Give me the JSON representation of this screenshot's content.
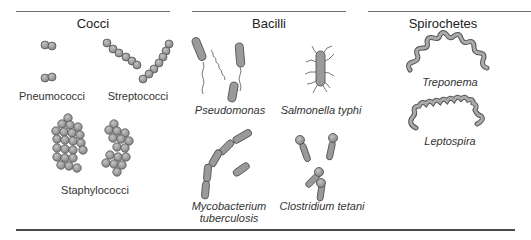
{
  "figure": {
    "groups": [
      {
        "title": "Cocci",
        "organisms": [
          {
            "name": "Pneumococci",
            "italic": false,
            "shape": "diplococci"
          },
          {
            "name": "Streptococci",
            "italic": false,
            "shape": "chains"
          },
          {
            "name": "Staphylococci",
            "italic": false,
            "shape": "clusters"
          }
        ]
      },
      {
        "title": "Bacilli",
        "organisms": [
          {
            "name": "Pseudomonas",
            "italic": true,
            "shape": "rod with polar flagellum"
          },
          {
            "name": "Salmonella typhi",
            "italic": true,
            "shape": "rod with peritrichous flagella"
          },
          {
            "name_line1": "Mycobacterium",
            "name_line2": "tuberculosis",
            "italic": true,
            "shape": "chained rods"
          },
          {
            "name": "Clostridium tetani",
            "italic": true,
            "shape": "drumstick rods with terminal spores"
          }
        ]
      },
      {
        "title": "Spirochetes",
        "organisms": [
          {
            "name": "Treponema",
            "italic": true,
            "shape": "spiral"
          },
          {
            "name": "Leptospira",
            "italic": true,
            "shape": "spiral with hooked ends"
          }
        ]
      }
    ],
    "colors": {
      "cell_fill": "#9a9a9a",
      "cell_stroke": "#555555",
      "rule": "#6e6e6e",
      "text": "#222222"
    }
  }
}
